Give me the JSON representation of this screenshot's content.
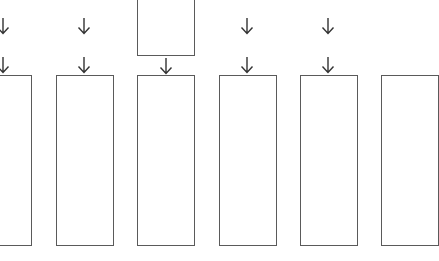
{
  "diagram": {
    "type": "flow-columns",
    "colors": {
      "background": "#ffffff",
      "box_border": "#5a5a5a",
      "arrow": "#333333"
    },
    "top_box": {
      "x": 137,
      "y": -10,
      "w": 58,
      "h": 66,
      "label": ""
    },
    "columns": [
      {
        "id": "col-1",
        "box": {
          "x": -26,
          "y": 75,
          "w": 58,
          "h": 171
        },
        "arrow_x": 3,
        "arrows": [
          "upper",
          "lower"
        ],
        "label": ""
      },
      {
        "id": "col-2",
        "box": {
          "x": 56,
          "y": 75,
          "w": 58,
          "h": 171
        },
        "arrow_x": 84,
        "arrows": [
          "upper",
          "lower"
        ],
        "label": ""
      },
      {
        "id": "col-3",
        "box": {
          "x": 137,
          "y": 75,
          "w": 58,
          "h": 171
        },
        "arrow_x": 166,
        "arrows": [
          "lower"
        ],
        "label": ""
      },
      {
        "id": "col-4",
        "box": {
          "x": 219,
          "y": 75,
          "w": 58,
          "h": 171
        },
        "arrow_x": 247,
        "arrows": [
          "upper",
          "lower"
        ],
        "label": ""
      },
      {
        "id": "col-5",
        "box": {
          "x": 300,
          "y": 75,
          "w": 58,
          "h": 171
        },
        "arrow_x": 328,
        "arrows": [
          "upper",
          "lower"
        ],
        "label": ""
      },
      {
        "id": "col-6",
        "box": {
          "x": 381,
          "y": 75,
          "w": 58,
          "h": 171
        },
        "arrow_x": 410,
        "arrows": [],
        "label": ""
      }
    ],
    "arrow_rows": {
      "upper": {
        "y": 17
      },
      "lower": {
        "y": 56
      }
    },
    "icons": {
      "arrow": "down-arrow-icon"
    }
  }
}
